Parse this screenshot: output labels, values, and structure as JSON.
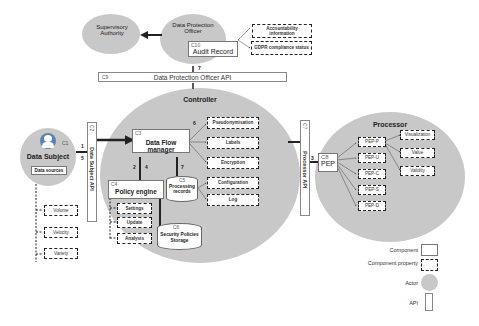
{
  "actors": {
    "supervisory_authority": "Supervisory Authority",
    "dpo": "Data Protection Officer",
    "controller": "Controller",
    "processor": "Processor",
    "data_subject": "Data Subject"
  },
  "components": {
    "c1": {
      "id": "C1",
      "name": "Data Subject"
    },
    "c3": {
      "id": "C3",
      "name": "Data Flow manager"
    },
    "c4": {
      "id": "C4",
      "name": "Policy engine"
    },
    "c5": {
      "id": "C5",
      "name": "Processing records"
    },
    "c6": {
      "id": "C6",
      "name": "Security Policies Storage"
    },
    "c8": {
      "id": "C8",
      "name": "PEP"
    },
    "c10": {
      "id": "C10",
      "name": "Audit Record"
    }
  },
  "apis": {
    "c2": {
      "id": "C2",
      "name": "Data Subject API"
    },
    "c7": {
      "id": "C7",
      "name": "Processor API"
    },
    "c9": {
      "id": "C9",
      "name": "Data Protection Officer API"
    }
  },
  "properties": {
    "data_sources": "Data sources",
    "volume": "Volume",
    "velocity": "Velocity",
    "variety": "Variety",
    "accountability": "Accountability information",
    "gdpr_status": "GDPR compliance status",
    "pseudonymisation": "Pseudonymisation",
    "labels": "Labels",
    "encryption": "Encryption",
    "configuration": "Configuration",
    "log": "Log",
    "settings": "Settings",
    "update": "Update",
    "analysis": "Analysis",
    "pep_p": "PEP-P",
    "pep_u": "PEP-U",
    "pep_c": "PEP-C",
    "pep_s": "PEP-S",
    "pep_d": "PEP-D",
    "visualization": "Visualization",
    "value": "Value",
    "validity": "Validity"
  },
  "flow_numbers": {
    "n1": "1",
    "n2": "2",
    "n3": "3",
    "n4": "4",
    "n5": "5",
    "n6": "6",
    "n7a": "7",
    "n7b": "7"
  },
  "legend": {
    "component": "Component",
    "component_property": "Component property",
    "actor": "Actor",
    "api": "API"
  },
  "colors": {
    "actor_fill": "#c8c8c8",
    "border": "#222222"
  }
}
